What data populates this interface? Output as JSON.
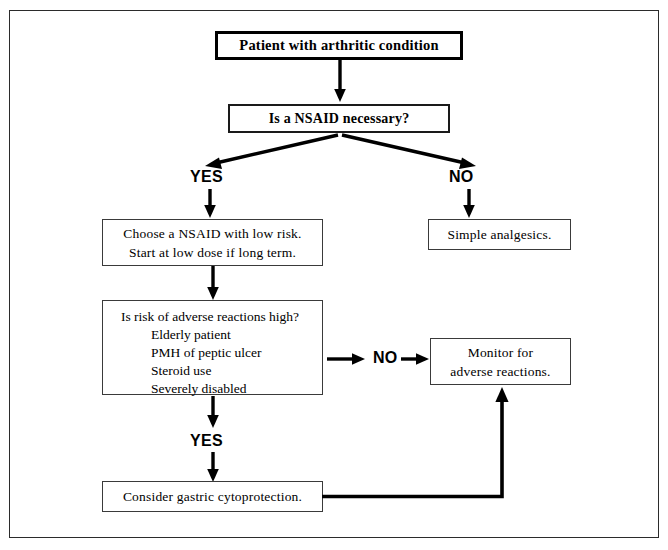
{
  "diagram": {
    "title_node": {
      "id": "patient-node",
      "text": "Patient with arthritic condition"
    },
    "decision_nsaid": {
      "id": "nsaid-decision",
      "text": "Is a NSAID necessary?"
    },
    "branch_labels": {
      "yes_top": "YES",
      "no_top": "NO",
      "no_middle": "NO",
      "yes_middle": "YES"
    },
    "choose_nsaid": {
      "id": "choose-nsaid-node",
      "line1": "Choose a NSAID with low risk.",
      "line2": "Start at low dose if long term."
    },
    "simple_analgesics": {
      "id": "simple-analgesics-node",
      "text": "Simple analgesics."
    },
    "risk_assessment": {
      "id": "risk-assessment-node",
      "heading": "Is risk of adverse reactions high?",
      "items": [
        "Elderly patient",
        "PMH of peptic ulcer",
        "Steroid use",
        "Severely disabled"
      ]
    },
    "monitor": {
      "id": "monitor-node",
      "line1": "Monitor for",
      "line2": "adverse reactions."
    },
    "cytoprotection": {
      "id": "cytoprotection-node",
      "text": "Consider gastric cytoprotection."
    },
    "colors": {
      "ink": "#000000",
      "frame": "#2b2b2b",
      "background": "#ffffff"
    }
  }
}
